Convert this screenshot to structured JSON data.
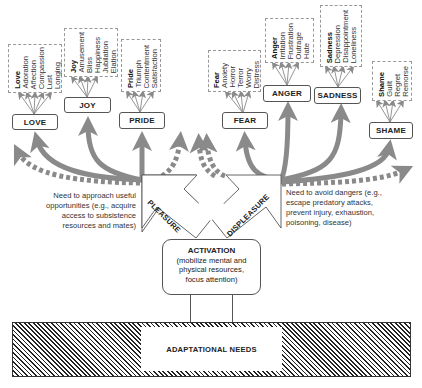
{
  "emotions": {
    "love": {
      "label": "LOVE",
      "words": [
        "Love",
        "Adoration",
        "Affection",
        "Compassion",
        "Lust",
        "Longing"
      ]
    },
    "joy": {
      "label": "JOY",
      "words": [
        "Joy",
        "Amusement",
        "Bliss",
        "Happiness",
        "Jubilation",
        "Elation"
      ]
    },
    "pride": {
      "label": "PRIDE",
      "words": [
        "Pride",
        "Triumph",
        "Contentment",
        "Satisfaction"
      ]
    },
    "fear": {
      "label": "FEAR",
      "words": [
        "Fear",
        "Anxiety",
        "Horror",
        "Terror",
        "Worry",
        "Distress"
      ]
    },
    "anger": {
      "label": "ANGER",
      "words": [
        "Anger",
        "Irritation",
        "Frustration",
        "Outrage",
        "Hate"
      ]
    },
    "sadness": {
      "label": "SADNESS",
      "words": [
        "Sadness",
        "Depression",
        "Disappointment",
        "Loneliness"
      ]
    },
    "shame": {
      "label": "SHAME",
      "words": [
        "Shame",
        "Guilt",
        "Regret",
        "Remorse"
      ]
    }
  },
  "valence": {
    "pleasure": "PLEASURE",
    "displeasure": "DISPLEASURE"
  },
  "notes": {
    "approach": [
      "Need to approach useful",
      "opportunities (e.g., acquire",
      "access to subsistence",
      "resources and mates)"
    ],
    "avoid": [
      "Need to avoid dangers (e.g.,",
      "escape predatory attacks,",
      "prevent injury, exhaustion,",
      "poisoning, disease)"
    ]
  },
  "activation": {
    "title": "ACTIVATION",
    "lines": [
      "(mobilize mental and",
      "physical resources,",
      "focus attention)"
    ]
  },
  "needs": {
    "label": "ADAPTATIONAL NEEDS"
  },
  "colors": {
    "arrow": "#8a8a8a",
    "box_border": "#555555",
    "dashed_border": "#999999",
    "hatch": "#222222"
  }
}
